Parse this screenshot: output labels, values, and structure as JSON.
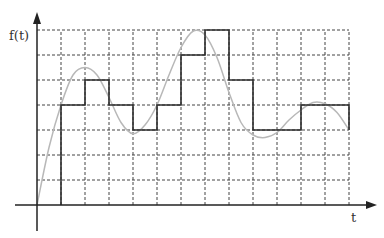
{
  "chart_data": {
    "type": "line",
    "title": "",
    "xlabel": "t",
    "ylabel": "f(t)",
    "grid": true,
    "legend": null,
    "axis_ranges": {
      "x": [
        0,
        13
      ],
      "y": [
        0,
        7
      ]
    },
    "grid_x": [
      1,
      2,
      3,
      4,
      5,
      6,
      7,
      8,
      9,
      10,
      11,
      12,
      13
    ],
    "grid_y": [
      1,
      2,
      3,
      4,
      5,
      6,
      7
    ],
    "series": [
      {
        "name": "sampled step approximation",
        "style": "step",
        "color": "#333333",
        "intervals": [
          {
            "x0": 1,
            "x1": 2,
            "value": 4
          },
          {
            "x0": 2,
            "x1": 3,
            "value": 5
          },
          {
            "x0": 3,
            "x1": 4,
            "value": 4
          },
          {
            "x0": 4,
            "x1": 5,
            "value": 3
          },
          {
            "x0": 5,
            "x1": 6,
            "value": 4
          },
          {
            "x0": 6,
            "x1": 7,
            "value": 6
          },
          {
            "x0": 7,
            "x1": 8,
            "value": 7
          },
          {
            "x0": 8,
            "x1": 9,
            "value": 5
          },
          {
            "x0": 9,
            "x1": 10,
            "value": 3
          },
          {
            "x0": 10,
            "x1": 11,
            "value": 3
          },
          {
            "x0": 11,
            "x1": 12,
            "value": 4
          },
          {
            "x0": 12,
            "x1": 13,
            "value": 4
          }
        ]
      },
      {
        "name": "continuous signal f(t)",
        "style": "smooth",
        "color": "#b0b0b0",
        "points": [
          [
            0,
            0
          ],
          [
            0.5,
            2.3
          ],
          [
            1,
            4.0
          ],
          [
            1.5,
            5.2
          ],
          [
            2,
            5.5
          ],
          [
            2.5,
            5.2
          ],
          [
            3,
            4.3
          ],
          [
            3.5,
            3.3
          ],
          [
            4,
            2.85
          ],
          [
            4.5,
            3.2
          ],
          [
            5,
            4.0
          ],
          [
            5.5,
            5.2
          ],
          [
            6,
            6.3
          ],
          [
            6.5,
            6.95
          ],
          [
            7,
            6.8
          ],
          [
            7.5,
            5.9
          ],
          [
            8,
            4.5
          ],
          [
            8.5,
            3.3
          ],
          [
            9,
            2.8
          ],
          [
            9.5,
            2.7
          ],
          [
            10,
            2.9
          ],
          [
            10.5,
            3.4
          ],
          [
            11,
            3.8
          ],
          [
            11.5,
            4.1
          ],
          [
            12,
            4.05
          ],
          [
            12.5,
            3.7
          ],
          [
            13,
            3.0
          ]
        ]
      }
    ]
  },
  "labels": {
    "y_axis": "f(t)",
    "x_axis": "t"
  }
}
